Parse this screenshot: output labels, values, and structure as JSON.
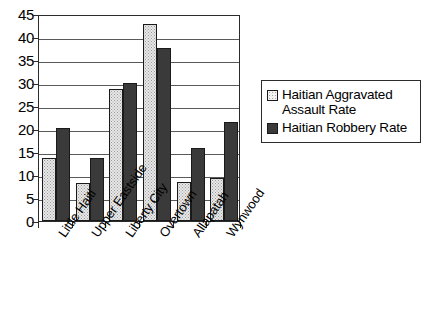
{
  "chart_data": {
    "type": "bar",
    "title": "",
    "xlabel": "",
    "ylabel": "",
    "ylim": [
      0,
      45
    ],
    "ytick_step": 5,
    "yticks": [
      0,
      5,
      10,
      15,
      20,
      25,
      30,
      35,
      40,
      45
    ],
    "grid": true,
    "legend_position": "right",
    "categories": [
      "Little Haiti",
      "Upper Eastside",
      "Liberty City",
      "Overtown",
      "Allapatah",
      "Wynwood"
    ],
    "series": [
      {
        "name": "Haitian Aggravated Assault Rate",
        "color": "#e8e8e8",
        "values": [
          13.7,
          8.2,
          28.7,
          42.9,
          8.5,
          9.4
        ]
      },
      {
        "name": "Haitian Robbery Rate",
        "color": "#3a3a3a",
        "values": [
          20.3,
          13.8,
          30.0,
          37.7,
          15.9,
          21.6
        ]
      }
    ]
  },
  "legend": {
    "entries": [
      {
        "label": "Haitian Aggravated Assault Rate",
        "swatch": "light-dotted-swatch"
      },
      {
        "label": "Haitian Robbery Rate",
        "swatch": "dark-solid-swatch"
      }
    ]
  }
}
